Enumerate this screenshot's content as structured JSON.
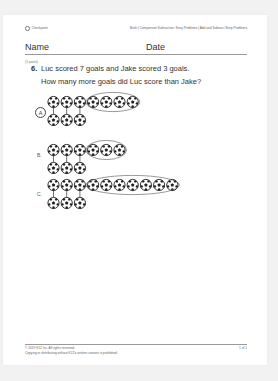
{
  "header": {
    "left_label": "Checkpoint",
    "left_icon": "checkpoint-circle-icon",
    "breadcrumb": "Math | Comparison Subtraction: Story Problems | Add and Subtract Story Problems"
  },
  "form": {
    "name_label": "Name",
    "date_label": "Date"
  },
  "question": {
    "points": "(1 point)",
    "number": "6.",
    "text": "Luc scored 7 goals and Jake scored 3 goals.",
    "prompt": "How many more goals did Luc score than Jake?"
  },
  "options": [
    {
      "label": "A",
      "selected": true,
      "top_count": 7,
      "bottom_count": 3,
      "circled_count": 4
    },
    {
      "label": "B.",
      "selected": false,
      "top_count": 6,
      "bottom_count": 3,
      "circled_count": 3
    },
    {
      "label": "C.",
      "selected": false,
      "top_count": 10,
      "bottom_count": 3,
      "circled_count": 7
    }
  ],
  "footer": {
    "copyright": "© 2019 K12 Inc. All rights reserved.",
    "notice": "Copying or distributing without K12's written consent is prohibited.",
    "page": "1 of 1"
  }
}
